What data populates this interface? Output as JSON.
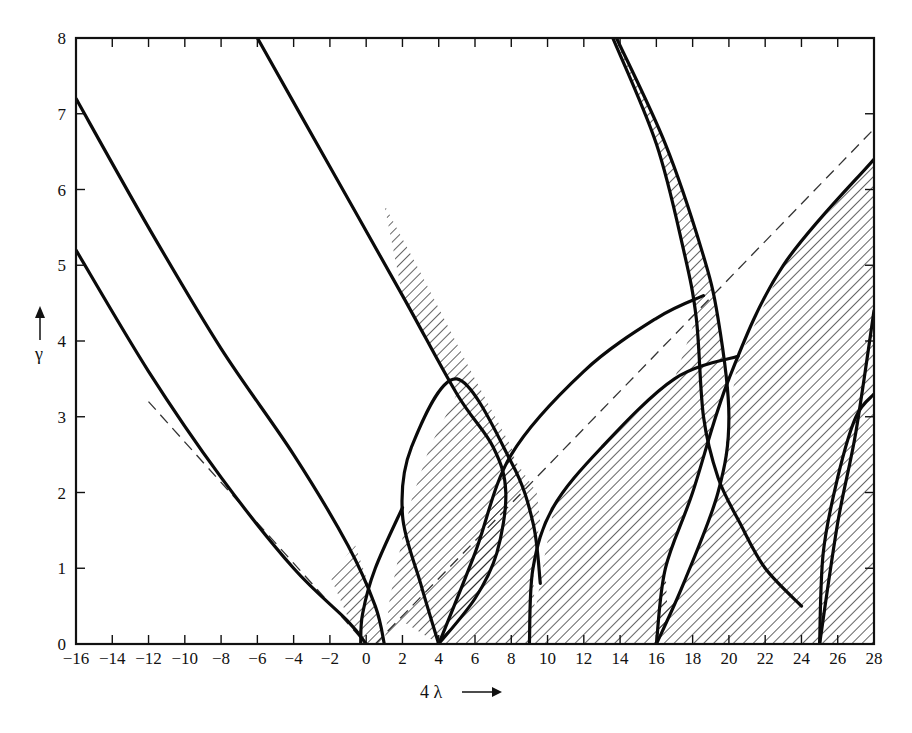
{
  "chart_data": {
    "type": "area",
    "title": "",
    "subtitle": "Stability chart (Strutt diagram) of the Mathieu equation; hatched = stable regions",
    "xlabel": "4 λ",
    "ylabel": "γ",
    "xlim": [
      -16,
      28
    ],
    "ylim": [
      0,
      8
    ],
    "grid": false,
    "legend": null,
    "x_ticks": [
      -16,
      -14,
      -12,
      -10,
      -8,
      -6,
      -4,
      -2,
      0,
      2,
      4,
      6,
      8,
      10,
      12,
      14,
      16,
      18,
      20,
      22,
      24,
      26,
      28
    ],
    "y_ticks": [
      0,
      1,
      2,
      3,
      4,
      5,
      6,
      7,
      8
    ],
    "boundary_curves": [
      {
        "name": "a0",
        "points": [
          [
            -16,
            5.2
          ],
          [
            -12,
            3.6
          ],
          [
            -8,
            2.2
          ],
          [
            -4,
            1.0
          ],
          [
            -1,
            0.3
          ],
          [
            0,
            0
          ]
        ]
      },
      {
        "name": "b1",
        "points": [
          [
            -16,
            7.2
          ],
          [
            -12,
            5.5
          ],
          [
            -8,
            3.9
          ],
          [
            -4,
            2.5
          ],
          [
            -1,
            1.3
          ],
          [
            0.5,
            0.5
          ],
          [
            1,
            0
          ]
        ]
      },
      {
        "name": "a1",
        "points": [
          [
            -0.3,
            0
          ],
          [
            -0.2,
            0.4
          ],
          [
            0.5,
            1.0
          ],
          [
            2,
            1.8
          ]
        ]
      },
      {
        "name": "b2",
        "points": [
          [
            -6,
            8
          ],
          [
            -2,
            6.3
          ],
          [
            2,
            4.6
          ],
          [
            5,
            3.3
          ],
          [
            7,
            2.6
          ],
          [
            7.7,
            2.0
          ],
          [
            7.2,
            1.2
          ],
          [
            6,
            0.6
          ],
          [
            4,
            0
          ]
        ]
      },
      {
        "name": "a2",
        "points": [
          [
            4,
            0
          ],
          [
            3,
            0.8
          ],
          [
            2,
            1.7
          ],
          [
            2.5,
            2.6
          ],
          [
            5,
            3.5
          ],
          [
            8,
            2.4
          ],
          [
            9.2,
            1.6
          ],
          [
            9.6,
            0.8
          ]
        ]
      },
      {
        "name": "b3",
        "points": [
          [
            13.6,
            8
          ],
          [
            16,
            6.6
          ],
          [
            17.5,
            5.2
          ],
          [
            18.2,
            4.3
          ],
          [
            18.6,
            3.0
          ],
          [
            19.4,
            2.2
          ],
          [
            20.6,
            1.6
          ],
          [
            22,
            1.0
          ],
          [
            24,
            0.5
          ]
        ]
      },
      {
        "name": "a3",
        "points": [
          [
            13.8,
            8
          ],
          [
            16.5,
            6.6
          ],
          [
            18.5,
            5.2
          ],
          [
            19.4,
            4.3
          ],
          [
            20,
            3.0
          ],
          [
            19.4,
            2.0
          ],
          [
            17.5,
            0.8
          ],
          [
            16,
            0
          ]
        ]
      },
      {
        "name": "b_upper_9",
        "points": [
          [
            4,
            0
          ],
          [
            6,
            1.2
          ],
          [
            8,
            2.5
          ],
          [
            12,
            3.6
          ],
          [
            16,
            4.3
          ],
          [
            18.6,
            4.6
          ]
        ]
      },
      {
        "name": "a_9",
        "points": [
          [
            9,
            0
          ],
          [
            9.2,
            1.0
          ],
          [
            10.3,
            1.8
          ],
          [
            13,
            2.6
          ],
          [
            17,
            3.5
          ],
          [
            20.5,
            3.8
          ]
        ]
      },
      {
        "name": "a4",
        "points": [
          [
            16,
            0
          ],
          [
            16.5,
            1.0
          ],
          [
            18,
            2.0
          ],
          [
            20,
            3.5
          ],
          [
            23,
            5.0
          ],
          [
            28,
            6.4
          ]
        ]
      },
      {
        "name": "b4",
        "points": [
          [
            25,
            0
          ],
          [
            25.2,
            1.2
          ],
          [
            26,
            2.2
          ],
          [
            27,
            3.0
          ],
          [
            28,
            3.3
          ]
        ]
      },
      {
        "name": "a5",
        "points": [
          [
            25,
            0
          ],
          [
            26,
            1.6
          ],
          [
            27,
            2.8
          ],
          [
            28,
            4.4
          ]
        ]
      }
    ],
    "tongue_tips_on_x_axis": [
      0,
      1,
      4,
      9,
      16,
      25
    ],
    "dashed_lines": [
      {
        "name": "left-asymptote",
        "points": [
          [
            -12,
            3.2
          ],
          [
            0,
            0
          ]
        ]
      },
      {
        "name": "right-asymptote",
        "points": [
          [
            0.5,
            0
          ],
          [
            28,
            6.8
          ]
        ]
      }
    ],
    "hatched_regions_description": "Stable regions between paired boundary curves emanating from 4λ = 0, 1, 4, 9, 16, 25"
  },
  "axes": {
    "x_label": "4 λ",
    "y_label": "γ",
    "x_arrow": "→",
    "y_arrow": "↑"
  }
}
